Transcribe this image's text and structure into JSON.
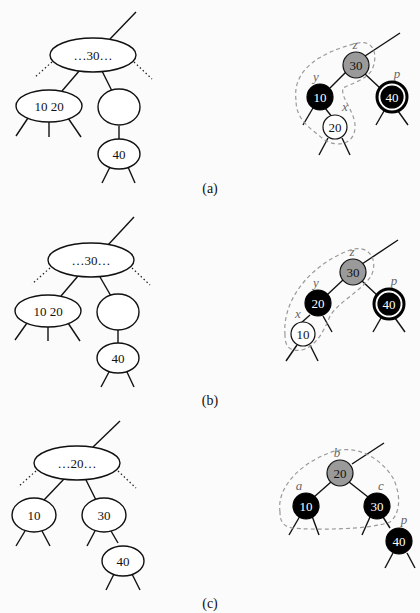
{
  "figure": {
    "panels": [
      {
        "id": "a",
        "caption": "(a)",
        "btree": {
          "root_label": "…30…",
          "left_label": "10  20",
          "right_label": "",
          "right_child_label": "40"
        },
        "rbtree": {
          "nodes": [
            {
              "key": "30",
              "color": "gray",
              "label": "z"
            },
            {
              "key": "10",
              "color": "black",
              "label": "y"
            },
            {
              "key": "40",
              "color": "double-black",
              "label": "p"
            },
            {
              "key": "20",
              "color": "white",
              "label": "x"
            }
          ]
        }
      },
      {
        "id": "b",
        "caption": "(b)",
        "btree": {
          "root_label": "…30…",
          "left_label": "10  20",
          "right_label": "",
          "right_child_label": "40"
        },
        "rbtree": {
          "nodes": [
            {
              "key": "30",
              "color": "gray",
              "label": "z"
            },
            {
              "key": "20",
              "color": "black",
              "label": "y"
            },
            {
              "key": "40",
              "color": "double-black",
              "label": "p"
            },
            {
              "key": "10",
              "color": "white",
              "label": "x"
            }
          ]
        }
      },
      {
        "id": "c",
        "caption": "(c)",
        "btree": {
          "root_label": "…20…",
          "left_label": "10",
          "right_label": "30",
          "right_child_label": "40"
        },
        "rbtree": {
          "nodes": [
            {
              "key": "20",
              "color": "gray",
              "label": "b"
            },
            {
              "key": "10",
              "color": "black",
              "label": "a"
            },
            {
              "key": "30",
              "color": "black",
              "label": "c"
            },
            {
              "key": "40",
              "color": "black",
              "label": "p"
            }
          ]
        }
      }
    ]
  }
}
